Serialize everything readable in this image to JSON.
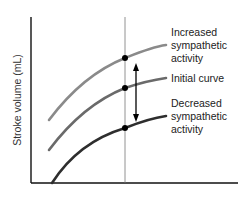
{
  "diagram": {
    "y_axis_label": "Stroke volume (mL)",
    "x_axis_label": "",
    "curves": [
      {
        "id": "increased",
        "label_lines": [
          "Increased",
          "sympathetic",
          "activity"
        ],
        "color": "#8a8a8a"
      },
      {
        "id": "initial",
        "label_lines": [
          "Initial curve"
        ],
        "color": "#6a6a6a"
      },
      {
        "id": "decreased",
        "label_lines": [
          "Decreased",
          "sympathetic",
          "activity"
        ],
        "color": "#2e2e2e"
      }
    ],
    "arrow": "double-headed vertical arrow between increased and decreased curves",
    "reference_line": "vertical line at fixed preload intersecting all curves"
  }
}
